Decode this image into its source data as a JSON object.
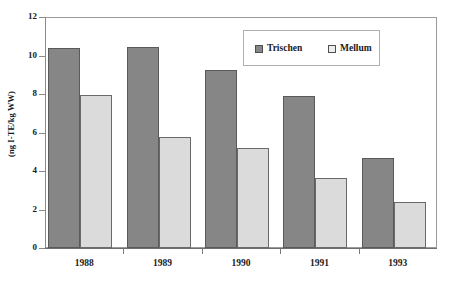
{
  "chart_data": {
    "type": "bar",
    "title": "",
    "xlabel": "",
    "ylabel": "(ng I-TE/kg WW)",
    "categories": [
      "1988",
      "1989",
      "1990",
      "1991",
      "1993"
    ],
    "series": [
      {
        "name": "Trischen",
        "color": "#868686",
        "values": [
          10.4,
          10.45,
          9.25,
          7.9,
          4.65
        ]
      },
      {
        "name": "Mellum",
        "color": "#dbdbdb",
        "values": [
          7.95,
          5.75,
          5.2,
          3.65,
          2.4
        ]
      }
    ],
    "ylim": [
      0,
      12
    ],
    "ytick_labels": [
      "0",
      "2",
      "4",
      "6",
      "8",
      "10",
      "12"
    ],
    "ytick_values": [
      0,
      2,
      4,
      6,
      8,
      10,
      12
    ],
    "grid": false,
    "legend_position": "upper-right-inside"
  },
  "legend": {
    "entries": [
      {
        "label": "Trischen",
        "swatch": "legend-swatch-trischen"
      },
      {
        "label": "Mellum",
        "swatch": "legend-swatch-mellum"
      }
    ]
  },
  "axes": {
    "y_title": "(ng I-TE/kg WW)"
  }
}
